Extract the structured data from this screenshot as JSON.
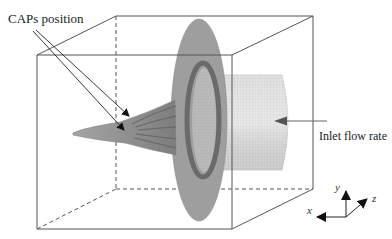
{
  "figure": {
    "type": "3D flow-domain schematic",
    "annotations": {
      "caps_position": "CAPs position",
      "inlet_flow_rate": "Inlet flow rate"
    },
    "axes": {
      "x": "x",
      "y": "y",
      "z": "z"
    },
    "colors": {
      "box_edge": "#555555",
      "disc": "#9a9a9a",
      "disc_inner_ring": "#6e6e6e",
      "cone": "#8e8e8e",
      "cone_ribs": "#666666",
      "cylinder": "#d8d8d8",
      "arrow": "#111111",
      "inlet_arrow": "#555555"
    }
  }
}
